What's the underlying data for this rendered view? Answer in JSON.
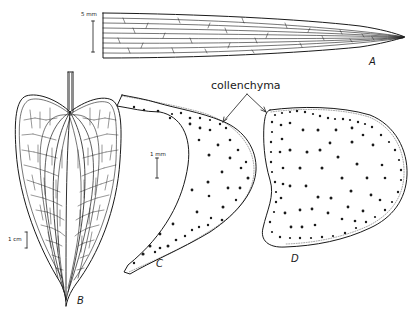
{
  "figure": {
    "panels": [
      {
        "id": "A",
        "label": "A",
        "description": "Elongate tapering leaf blade with parallel venation",
        "scale_bar": "5 mm"
      },
      {
        "id": "B",
        "label": "B",
        "description": "Cordate (heart-shaped) leaf with reticulate venation and petiole",
        "scale_bar": "1 cm"
      },
      {
        "id": "C",
        "label": "C",
        "description": "Cross-section of petiole (crescent-shaped) with scattered vascular bundles",
        "scale_bar": "1 mm"
      },
      {
        "id": "D",
        "label": "D",
        "description": "Cross-section of petiole (rounded) with scattered vascular bundles"
      }
    ],
    "callout": {
      "text": "collenchyma",
      "targets": [
        "C",
        "D"
      ]
    },
    "colors": {
      "ink": "#1a1a1a",
      "background": "#ffffff"
    }
  }
}
